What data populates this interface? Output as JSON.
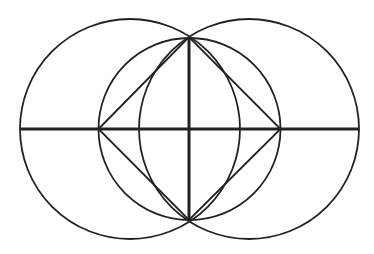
{
  "diagram": {
    "stroke_color": "#222222",
    "background": "#ffffff",
    "circles": [
      {
        "id": "left-circle",
        "cx": 130,
        "cy": 129,
        "r": 110
      },
      {
        "id": "right-circle",
        "cx": 249,
        "cy": 129,
        "r": 110
      },
      {
        "id": "center-circle",
        "cx": 189.5,
        "cy": 129,
        "r": 91
      }
    ],
    "lines": [
      {
        "id": "horizontal-axis",
        "x1": 21,
        "y1": 129,
        "x2": 359,
        "y2": 129,
        "width": 3
      },
      {
        "id": "vertical-axis",
        "x1": 189,
        "y1": 37,
        "x2": 189,
        "y2": 220,
        "width": 3
      }
    ],
    "rhombus": {
      "points": [
        [
          98.5,
          129
        ],
        [
          189,
          37
        ],
        [
          280.5,
          129
        ],
        [
          189,
          220
        ]
      ]
    }
  }
}
